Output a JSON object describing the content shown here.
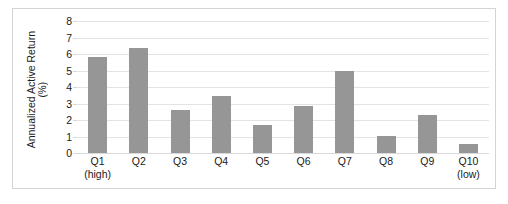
{
  "chart_data": {
    "type": "bar",
    "title": "",
    "xlabel": "",
    "ylabel": "Annualized Active Return (%)",
    "ylabel_line1": "Annualized Active Return",
    "ylabel_line2": "(%)",
    "ylim": [
      0,
      8
    ],
    "yticks": [
      8,
      7,
      6,
      5,
      4,
      3,
      2,
      1,
      0
    ],
    "grid": true,
    "legend": "none",
    "bar_color": "#969696",
    "gridline_color": "#e3e3e3",
    "categories": [
      "Q1",
      "Q2",
      "Q3",
      "Q4",
      "Q5",
      "Q6",
      "Q7",
      "Q8",
      "Q9",
      "Q10"
    ],
    "category_sublabels": [
      "(high)",
      "",
      "",
      "",
      "",
      "",
      "",
      "",
      "",
      "(low)"
    ],
    "values": [
      5.8,
      6.35,
      2.6,
      3.45,
      1.7,
      2.85,
      5.0,
      1.05,
      2.3,
      0.55
    ]
  }
}
